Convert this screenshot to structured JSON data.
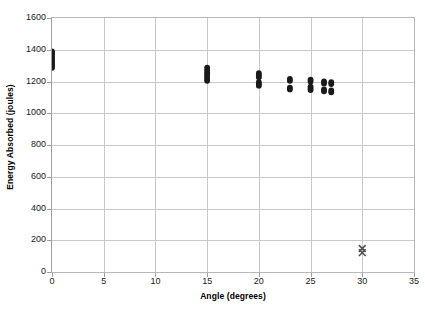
{
  "chart_data": {
    "type": "scatter",
    "title": "",
    "xlabel": "Angle (degrees)",
    "ylabel": "Energy Absorbed (joules)",
    "xlim": [
      0,
      35
    ],
    "ylim": [
      0,
      1600
    ],
    "xticks": [
      0,
      5,
      10,
      15,
      20,
      25,
      30,
      35
    ],
    "yticks": [
      0,
      200,
      400,
      600,
      800,
      1000,
      1200,
      1400,
      1600
    ],
    "grid": "horizontal-and-vertical",
    "legend": "none",
    "series": [
      {
        "name": "Energy Absorbed",
        "marker": "filled-circle",
        "color": "#1a1a1a",
        "points": [
          {
            "x": 0,
            "y": 1390
          },
          {
            "x": 0,
            "y": 1378
          },
          {
            "x": 0,
            "y": 1368
          },
          {
            "x": 0,
            "y": 1356
          },
          {
            "x": 0,
            "y": 1344
          },
          {
            "x": 0,
            "y": 1332
          },
          {
            "x": 0,
            "y": 1320
          },
          {
            "x": 0,
            "y": 1308
          },
          {
            "x": 0,
            "y": 1296
          },
          {
            "x": 0,
            "y": 1286
          },
          {
            "x": 15,
            "y": 1288
          },
          {
            "x": 15,
            "y": 1272
          },
          {
            "x": 15,
            "y": 1258
          },
          {
            "x": 15,
            "y": 1244
          },
          {
            "x": 15,
            "y": 1230
          },
          {
            "x": 15,
            "y": 1216
          },
          {
            "x": 15,
            "y": 1204
          },
          {
            "x": 20,
            "y": 1252
          },
          {
            "x": 20,
            "y": 1238
          },
          {
            "x": 20,
            "y": 1226
          },
          {
            "x": 20,
            "y": 1196
          },
          {
            "x": 20,
            "y": 1184
          },
          {
            "x": 20,
            "y": 1174
          },
          {
            "x": 23,
            "y": 1216
          },
          {
            "x": 23,
            "y": 1204
          },
          {
            "x": 23,
            "y": 1162
          },
          {
            "x": 23,
            "y": 1150
          },
          {
            "x": 25,
            "y": 1212
          },
          {
            "x": 25,
            "y": 1200
          },
          {
            "x": 25,
            "y": 1168
          },
          {
            "x": 25,
            "y": 1156
          },
          {
            "x": 25,
            "y": 1146
          },
          {
            "x": 26.3,
            "y": 1200
          },
          {
            "x": 26.3,
            "y": 1188
          },
          {
            "x": 26.3,
            "y": 1150
          },
          {
            "x": 26.3,
            "y": 1138
          },
          {
            "x": 27,
            "y": 1196
          },
          {
            "x": 27,
            "y": 1184
          },
          {
            "x": 27,
            "y": 1144
          },
          {
            "x": 27,
            "y": 1132
          }
        ]
      },
      {
        "name": "Outlier",
        "marker": "x-cross",
        "color": "#4d4d4d",
        "points": [
          {
            "x": 30,
            "y": 148
          },
          {
            "x": 30,
            "y": 122
          }
        ]
      }
    ]
  }
}
